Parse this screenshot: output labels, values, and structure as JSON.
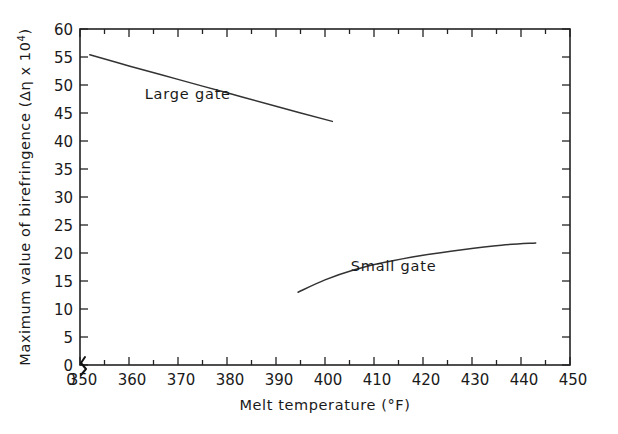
{
  "chart_data": {
    "type": "line",
    "title": "",
    "xlabel": "Melt temperature (°F)",
    "ylabel": "Maximum value of birefringence (Δη x 10⁴)",
    "ylabel_main": "Maximum value of birefringence  (Δη x 10",
    "ylabel_exp": "4",
    "ylabel_tail": ")",
    "xlim": [
      350,
      450
    ],
    "ylim": [
      0,
      60
    ],
    "grid": false,
    "legend_position": "inline-annotation",
    "x_tick_labels": [
      "350",
      "360",
      "370",
      "380",
      "390",
      "400",
      "410",
      "420",
      "430",
      "440",
      "450"
    ],
    "x_tick_values": [
      350,
      360,
      370,
      380,
      390,
      400,
      410,
      420,
      430,
      440,
      450
    ],
    "x_minor_tick_values": [
      355,
      365,
      375,
      385,
      395,
      405,
      415,
      425,
      435,
      445
    ],
    "x_origin_label": "0",
    "axis_break": true,
    "y_tick_labels": [
      "0",
      "5",
      "10",
      "15",
      "20",
      "25",
      "30",
      "35",
      "40",
      "45",
      "50",
      "55",
      "60"
    ],
    "y_tick_values": [
      0,
      5,
      10,
      15,
      20,
      25,
      30,
      35,
      40,
      45,
      50,
      55,
      60
    ],
    "series": [
      {
        "name": "Large gate",
        "label": "Large gate",
        "label_x": 372,
        "label_y": 47.5,
        "color": "#333333",
        "x": [
          352,
          360,
          370,
          380,
          390,
          401.5
        ],
        "values": [
          55.4,
          53.4,
          51.0,
          48.6,
          46.2,
          43.5
        ]
      },
      {
        "name": "Small gate",
        "label": "Small gate",
        "label_x": 414,
        "label_y": 16.8,
        "color": "#333333",
        "x": [
          394.5,
          400,
          406,
          412,
          420,
          428,
          436,
          443
        ],
        "values": [
          13.0,
          15.2,
          17.0,
          18.3,
          19.6,
          20.6,
          21.4,
          21.8
        ]
      }
    ]
  },
  "geometry": {
    "plot_left": 80,
    "plot_right": 570,
    "plot_top": 29,
    "plot_bottom": 365
  }
}
